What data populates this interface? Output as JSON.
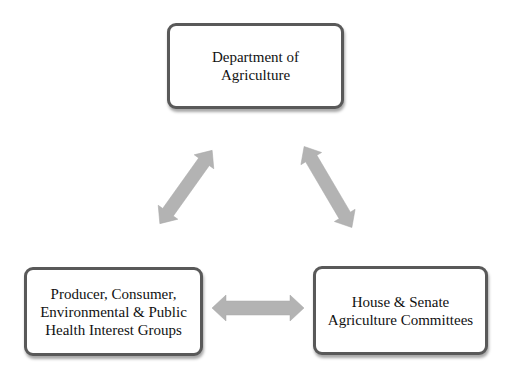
{
  "diagram": {
    "type": "iron-triangle",
    "nodes": [
      {
        "id": "top",
        "label": "Department of\nAgriculture"
      },
      {
        "id": "left",
        "label": "Producer, Consumer,\nEnvironmental & Public\nHealth Interest Groups"
      },
      {
        "id": "right",
        "label": "House & Senate\nAgriculture Committees"
      }
    ],
    "edges": [
      {
        "from": "top",
        "to": "left",
        "direction": "bidirectional"
      },
      {
        "from": "top",
        "to": "right",
        "direction": "bidirectional"
      },
      {
        "from": "left",
        "to": "right",
        "direction": "bidirectional"
      }
    ],
    "colors": {
      "box_border": "#595959",
      "box_fill": "#ffffff",
      "arrow_fill": "#b3b3b3",
      "text": "#111111"
    }
  }
}
